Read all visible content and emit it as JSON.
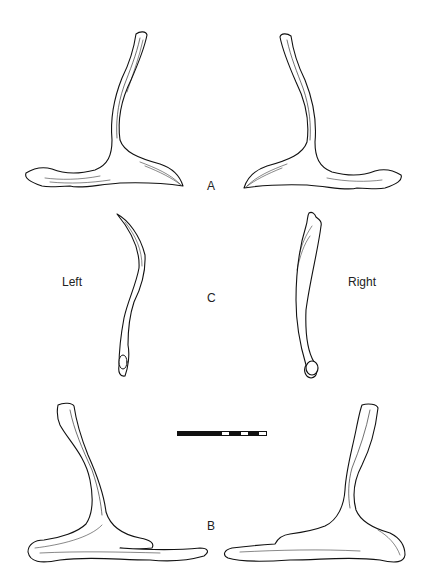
{
  "figure": {
    "labels": {
      "view_a": "A",
      "view_b": "B",
      "view_c": "C",
      "side_left": "Left",
      "side_right": "Right"
    },
    "scale_bar": {
      "segments": [
        {
          "color": "#111111",
          "width": 44
        },
        {
          "color": "#ffffff",
          "width": 7
        },
        {
          "color": "#111111",
          "width": 12
        },
        {
          "color": "#ffffff",
          "width": 7
        },
        {
          "color": "#111111",
          "width": 11
        },
        {
          "color": "#ffffff",
          "width": 7
        }
      ]
    },
    "colors": {
      "ink": "#111111",
      "background": "#ffffff"
    }
  }
}
